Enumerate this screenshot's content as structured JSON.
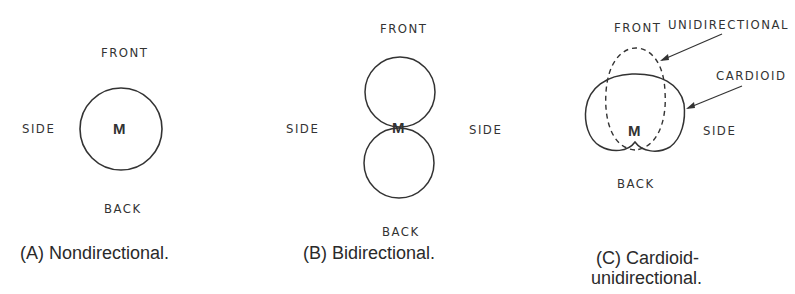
{
  "figures": [
    {
      "id": "A",
      "caption": "(A) Nondirectional.",
      "labels": {
        "front": "FRONT",
        "back": "BACK",
        "side_left": "SIDE",
        "center": "M"
      },
      "pattern": "circle"
    },
    {
      "id": "B",
      "caption": "(B) Bidirectional.",
      "labels": {
        "front": "FRONT",
        "back": "BACK",
        "side_left": "SIDE",
        "side_right": "SIDE",
        "center": "M"
      },
      "pattern": "figure-eight"
    },
    {
      "id": "C",
      "caption_line1": "(C) Cardioid-",
      "caption_line2": "unidirectional.",
      "labels": {
        "front": "FRONT",
        "back": "BACK",
        "side_right": "SIDE",
        "center": "M",
        "callout_uni": "UNIDIRECTIONAL",
        "callout_cardioid": "CARDIOID"
      },
      "pattern": "cardioid-and-unidirectional"
    }
  ]
}
